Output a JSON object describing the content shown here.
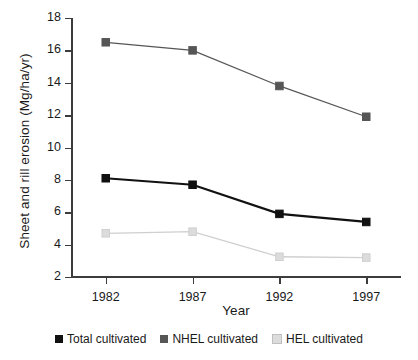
{
  "chart_data": {
    "type": "line",
    "title": "",
    "xlabel": "Year",
    "ylabel": "Sheet and rill erosion (Mg/ha/yr)",
    "categories": [
      "1982",
      "1987",
      "1992",
      "1997"
    ],
    "x": [
      1982,
      1987,
      1992,
      1997
    ],
    "xlim": [
      1980,
      1999
    ],
    "ylim": [
      2,
      18
    ],
    "yticks": [
      2,
      4,
      6,
      8,
      10,
      12,
      14,
      16,
      18
    ],
    "ytick_labels": [
      "2",
      "4",
      "6",
      "8",
      "10",
      "12",
      "14",
      "16",
      "18"
    ],
    "grid": false,
    "legend_position": "bottom",
    "series": [
      {
        "name": "Total cultivated",
        "values": [
          8.1,
          7.7,
          5.9,
          5.4
        ],
        "color": "#111111",
        "marker": "square",
        "marker_fill": "#111111",
        "line_width": 2.2
      },
      {
        "name": "NHEL cultivated",
        "values": [
          16.5,
          16.0,
          13.8,
          11.9
        ],
        "color": "#565656",
        "marker": "square",
        "marker_fill": "#565656",
        "line_width": 1.3
      },
      {
        "name": "HEL cultivated",
        "values": [
          4.7,
          4.8,
          3.25,
          3.2
        ],
        "color": "#cfcfcf",
        "marker": "square",
        "marker_fill": "#dcdcdc",
        "line_width": 1.3
      }
    ]
  },
  "legend": {
    "items": [
      {
        "label": "Total cultivated",
        "color": "#111111"
      },
      {
        "label": "NHEL cultivated",
        "color": "#565656"
      },
      {
        "label": "HEL cultivated",
        "color": "#dcdcdc"
      }
    ]
  }
}
